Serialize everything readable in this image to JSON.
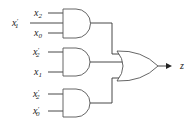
{
  "diagram": {
    "type": "logic-circuit",
    "gates": [
      {
        "id": "and1",
        "type": "AND",
        "inputs": [
          "x2",
          "x1'",
          "x0"
        ]
      },
      {
        "id": "and2",
        "type": "AND",
        "inputs": [
          "x2'",
          "x1"
        ]
      },
      {
        "id": "and3",
        "type": "AND",
        "inputs": [
          "x2'",
          "x0'"
        ]
      },
      {
        "id": "or1",
        "type": "OR",
        "inputs": [
          "and1",
          "and2",
          "and3"
        ],
        "output": "z"
      }
    ],
    "labels": {
      "g1_in1": {
        "base": "x",
        "sub": "2",
        "prime": ""
      },
      "g1_in2": {
        "base": "x",
        "sub": "1",
        "prime": "′"
      },
      "g1_in3": {
        "base": "x",
        "sub": "0",
        "prime": ""
      },
      "g2_in1": {
        "base": "x",
        "sub": "2",
        "prime": "′"
      },
      "g2_in2": {
        "base": "x",
        "sub": "1",
        "prime": ""
      },
      "g3_in1": {
        "base": "x",
        "sub": "2",
        "prime": "′"
      },
      "g3_in2": {
        "base": "x",
        "sub": "0",
        "prime": "′"
      },
      "output": "z"
    },
    "colors": {
      "line": "#333333",
      "gate_outline": "#555555",
      "background": "#ffffff"
    }
  }
}
